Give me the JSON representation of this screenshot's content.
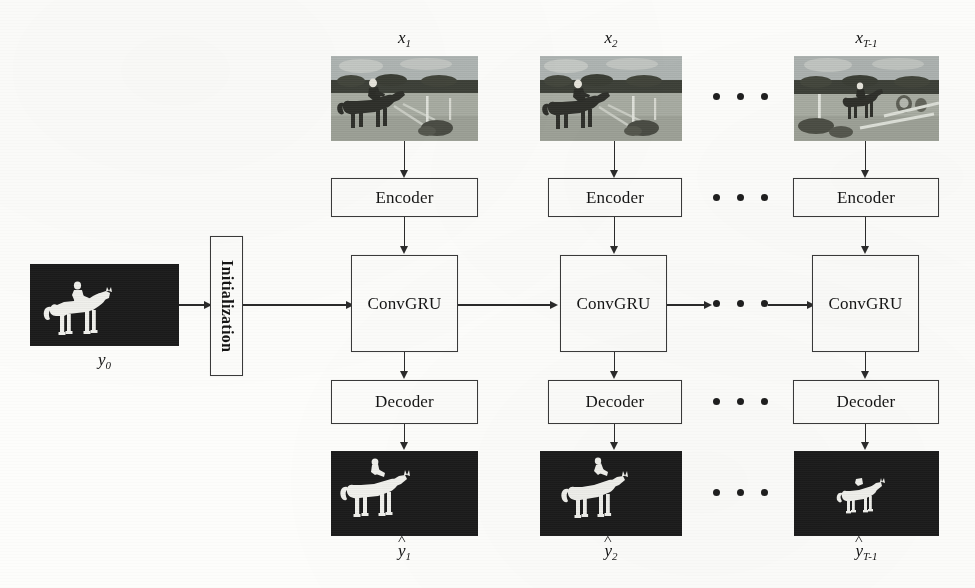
{
  "figure": {
    "background_color": "#fdfdfb",
    "line_color": "#2b2b2b",
    "box_fill": "#fcfcfa",
    "mask_background": "#1b1b1b",
    "mask_foreground": "#f2f2ee"
  },
  "initialization": {
    "label": "Initialization"
  },
  "ellipsis": {
    "glyph": "• • •",
    "count": 3
  },
  "columns": [
    {
      "id": "t1",
      "input_label": "x",
      "input_sub": "1",
      "encoder_label": "Encoder",
      "convgru_label": "ConvGRU",
      "decoder_label": "Decoder",
      "output_label": "y",
      "output_sub": "1",
      "input_caption": "x1",
      "output_caption": "ŷ1"
    },
    {
      "id": "t2",
      "input_label": "x",
      "input_sub": "2",
      "encoder_label": "Encoder",
      "convgru_label": "ConvGRU",
      "decoder_label": "Decoder",
      "output_label": "y",
      "output_sub": "2",
      "input_caption": "x2",
      "output_caption": "ŷ2"
    },
    {
      "id": "tT1",
      "input_label": "x",
      "input_sub": "T-1",
      "encoder_label": "Encoder",
      "convgru_label": "ConvGRU",
      "decoder_label": "Decoder",
      "output_label": "y",
      "output_sub": "T-1",
      "input_caption": "xT-1",
      "output_caption": "ŷT-1"
    }
  ],
  "initial_mask": {
    "label": "y",
    "sub": "0",
    "caption": "y0",
    "description": "binary segmentation mask of horse and rider"
  }
}
